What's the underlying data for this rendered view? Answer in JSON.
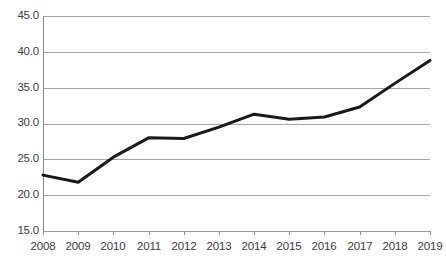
{
  "chart_data": {
    "type": "line",
    "title": "",
    "subtitle": "",
    "xlabel": "",
    "ylabel": "",
    "categories": [
      "2008",
      "2009",
      "2010",
      "2011",
      "2012",
      "2013",
      "2014",
      "2015",
      "2016",
      "2017",
      "2018",
      "2019"
    ],
    "x": [
      2008,
      2009,
      2010,
      2011,
      2012,
      2013,
      2014,
      2015,
      2016,
      2017,
      2018,
      2019
    ],
    "values": [
      22.8,
      21.8,
      25.3,
      28.0,
      27.9,
      29.5,
      31.3,
      30.6,
      30.9,
      32.3,
      35.6,
      38.8
    ],
    "series": [
      {
        "name": "",
        "values": [
          22.8,
          21.8,
          25.3,
          28.0,
          27.9,
          29.5,
          31.3,
          30.6,
          30.9,
          32.3,
          35.6,
          38.8
        ],
        "color": "#1a1a1a"
      }
    ],
    "ylim": [
      15.0,
      45.0
    ],
    "ytick_labels": [
      "45.0",
      "40.0",
      "35.0",
      "30.0",
      "25.0",
      "20.0",
      "15.0"
    ],
    "yticks": [
      45.0,
      40.0,
      35.0,
      30.0,
      25.0,
      20.0,
      15.0
    ],
    "grid": true,
    "grid_axis": "y",
    "legend": false,
    "legend_position": "none",
    "markers": false,
    "annotations": [],
    "colors": {
      "line": "#1a1a1a",
      "gridline": "#a6a6a6",
      "axis": "#868686",
      "tick_label": "#3b3b3b",
      "background": "#ffffff"
    }
  }
}
